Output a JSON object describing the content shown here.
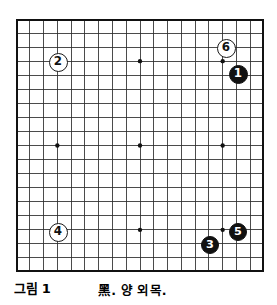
{
  "figure": {
    "caption_label": "그림 1",
    "caption_description": "黑. 양 외목.",
    "board_size": 19,
    "board_type": "go-board-19x19"
  },
  "colors": {
    "background": "#ffffff",
    "grid_line": "#2b2b2b",
    "border_line": "#111111",
    "star_point": "#111111",
    "black_stone_fill": "#111111",
    "black_stone_text": "#ffffff",
    "white_stone_fill": "#ffffff",
    "white_stone_text": "#111111",
    "white_stone_border": "#1a1a1a"
  },
  "board": {
    "star_points": [
      {
        "col": 3,
        "row": 3
      },
      {
        "col": 9,
        "row": 3
      },
      {
        "col": 15,
        "row": 3
      },
      {
        "col": 3,
        "row": 9
      },
      {
        "col": 9,
        "row": 9
      },
      {
        "col": 15,
        "row": 9
      },
      {
        "col": 3,
        "row": 15
      },
      {
        "col": 9,
        "row": 15
      },
      {
        "col": 15,
        "row": 15
      }
    ],
    "stones": [
      {
        "move": "1",
        "color": "black",
        "col": 16,
        "row": 3.9,
        "x": 238,
        "y": 74,
        "r": 9.5
      },
      {
        "move": "2",
        "color": "white",
        "col": 3,
        "row": 3,
        "x": 58,
        "y": 62,
        "r": 9.5
      },
      {
        "move": "3",
        "color": "black",
        "col": 14,
        "row": 16,
        "x": 210,
        "y": 245,
        "r": 9.0
      },
      {
        "move": "4",
        "color": "white",
        "col": 3,
        "row": 15,
        "x": 58,
        "y": 232,
        "r": 9.5
      },
      {
        "move": "5",
        "color": "black",
        "col": 16,
        "row": 15,
        "x": 238,
        "y": 232,
        "r": 9.0
      },
      {
        "move": "6",
        "color": "white",
        "col": 15,
        "row": 2,
        "x": 226,
        "y": 48,
        "r": 9.5
      }
    ]
  },
  "chart_data": {
    "type": "table",
    "categories": [
      "1",
      "2",
      "3",
      "4",
      "5",
      "6"
    ],
    "series": [
      {
        "name": "move-color",
        "values": [
          "black",
          "white",
          "black",
          "white",
          "black",
          "white"
        ]
      },
      {
        "name": "grid-column",
        "values": [
          16,
          3,
          14,
          3,
          16,
          15
        ]
      },
      {
        "name": "grid-row",
        "values": [
          3.9,
          3,
          16,
          15,
          15,
          2
        ]
      }
    ],
    "xlabel": "move number",
    "ylabel": "board intersection"
  }
}
